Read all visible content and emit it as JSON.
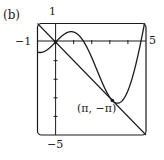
{
  "panel_label": "(b)",
  "chart_data": {
    "type": "line",
    "title": "",
    "xlabel": "",
    "ylabel": "",
    "xlim": [
      -1,
      5
    ],
    "ylim": [
      -5,
      1
    ],
    "grid": false,
    "tick_labels": {
      "x_min": "−1",
      "x_max": "5",
      "y_max": "1",
      "y_min": "−5"
    },
    "x_ticks": [
      1,
      2,
      3,
      4
    ],
    "y_ticks": [
      -1,
      -2,
      -3,
      -4
    ],
    "series": [
      {
        "name": "f(x) = x cos x",
        "kind": "curve",
        "x": [
          -1,
          -0.5,
          0,
          0.5,
          0.86,
          1.5,
          2,
          2.5,
          3,
          3.14159,
          3.43,
          4,
          4.5,
          5
        ],
        "y": [
          -0.54,
          -0.44,
          0,
          0.44,
          0.56,
          0.11,
          -0.83,
          -2.0,
          -2.97,
          -3.14159,
          -3.29,
          -2.61,
          -0.95,
          1.42
        ]
      },
      {
        "name": "tangent y = -x",
        "kind": "line",
        "x": [
          -1,
          5
        ],
        "y": [
          1,
          -5
        ]
      }
    ],
    "annotations": [
      {
        "text": "(π, −π)",
        "x": 3.14159,
        "y": -3.14159,
        "marker": "point"
      },
      {
        "text": "",
        "x": 0,
        "y": 0,
        "marker": "point"
      }
    ]
  }
}
